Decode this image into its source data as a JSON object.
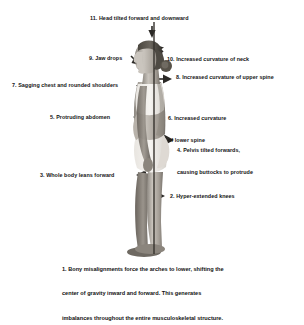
{
  "document": {
    "type": "postural-misalignment-diagram",
    "subject": "side-profile figure with vertical plumb line"
  },
  "figure": {
    "name": "lateral-posture-photograph",
    "plumb_line_label": "vertical-plumb-line",
    "colors": {
      "background": "#ffffff",
      "text": "#141414",
      "body_light": "#cfcbc6",
      "body_mid": "#9d9790",
      "body_dark": "#6d6862",
      "hair_dark": "#3a3733",
      "garment_light": "#f2f0ec",
      "plumb_line": "#3a3733",
      "arrow": "#2b2926"
    }
  },
  "annotations": [
    {
      "id": 11,
      "name": "annotation-head-tilt",
      "text": "11. Head tilted forward and downward",
      "side": "top",
      "lines": [
        "11. Head tilted forward and downward"
      ]
    },
    {
      "id": 9,
      "name": "annotation-jaw-drops",
      "text": "9. Jaw drops",
      "side": "left",
      "lines": [
        "9. Jaw drops"
      ]
    },
    {
      "id": 10,
      "name": "annotation-neck-curvature",
      "text": "10. Increased curvature of neck",
      "side": "right",
      "lines": [
        "10. Increased curvature of neck"
      ]
    },
    {
      "id": 8,
      "name": "annotation-upper-spine-curvature",
      "text": "8. Increased curvature of upper spine",
      "side": "right",
      "lines": [
        "8. Increased curvature of upper spine"
      ]
    },
    {
      "id": 7,
      "name": "annotation-sagging-chest",
      "text": "7. Sagging chest and rounded shoulders",
      "side": "left",
      "lines": [
        "7. Sagging chest and rounded shoulders"
      ]
    },
    {
      "id": 6,
      "name": "annotation-lower-spine-curvature",
      "text": "6. Increased curvature of lower spine",
      "side": "right",
      "lines": [
        "6. Increased curvature",
        "of lower spine"
      ]
    },
    {
      "id": 5,
      "name": "annotation-protruding-abdomen",
      "text": "5. Protruding abdomen",
      "side": "left",
      "lines": [
        "5. Protruding abdomen"
      ]
    },
    {
      "id": 4,
      "name": "annotation-pelvis-tilt",
      "text": "4. Pelvis tilted forwards, causing buttocks to protrude",
      "side": "right",
      "lines": [
        "4. Pelvis tilted forwards,",
        "causing buttocks to protrude"
      ]
    },
    {
      "id": 3,
      "name": "annotation-body-leans-forward",
      "text": "3. Whole body leans forward",
      "side": "left",
      "lines": [
        "3. Whole body leans forward"
      ]
    },
    {
      "id": 2,
      "name": "annotation-hyperextended-knees",
      "text": "2. Hyper-extended knees",
      "side": "right",
      "lines": [
        "2. Hyper-extended knees"
      ]
    }
  ],
  "caption": {
    "name": "caption-bony-misalignments",
    "lines": [
      "1. Bony misalignments force the arches to lower, shifting the",
      "center of gravity inward and forward. This generates",
      "imbalances throughout the entire musculoskeletal structure."
    ],
    "line1": "1. Bony misalignments force the arches to lower, shifting the",
    "line2": "center of gravity inward and forward. This generates",
    "line3": "imbalances throughout the entire musculoskeletal structure."
  }
}
